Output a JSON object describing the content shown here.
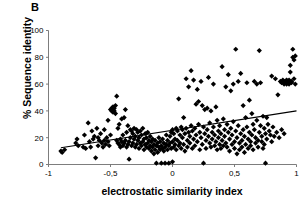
{
  "panel": {
    "label": "B"
  },
  "chart_data": {
    "type": "scatter",
    "title": "",
    "xlabel": "electrostatic similarity index",
    "ylabel": "% Sequence identity",
    "xlim": [
      -1,
      1
    ],
    "ylim": [
      0,
      100
    ],
    "xticks": [
      -1,
      -0.5,
      0,
      0.5,
      1
    ],
    "xticklabels": [
      "-1",
      "-0,5",
      "0",
      "0,5",
      "1"
    ],
    "yticks": [
      0,
      20,
      40,
      60,
      80,
      100
    ],
    "yticklabels": [
      "0",
      "20",
      "40",
      "60",
      "80",
      "100"
    ],
    "grid": false,
    "legend": null,
    "marker": "diamond",
    "marker_color": "#000000",
    "marker_size": 2.6,
    "trendline": {
      "type": "linear",
      "color": "#000000",
      "x_start": -0.9,
      "y_start": 12.5,
      "x_end": 1.0,
      "y_end": 40.0
    },
    "points": [
      [
        -0.9,
        10
      ],
      [
        -0.89,
        9
      ],
      [
        -0.87,
        11
      ],
      [
        -0.78,
        16
      ],
      [
        -0.77,
        19
      ],
      [
        -0.76,
        14
      ],
      [
        -0.72,
        13
      ],
      [
        -0.71,
        22
      ],
      [
        -0.7,
        12
      ],
      [
        -0.68,
        31
      ],
      [
        -0.67,
        17
      ],
      [
        -0.66,
        13
      ],
      [
        -0.65,
        25
      ],
      [
        -0.64,
        19
      ],
      [
        -0.63,
        21
      ],
      [
        -0.62,
        5
      ],
      [
        -0.61,
        27
      ],
      [
        -0.6,
        14
      ],
      [
        -0.6,
        20
      ],
      [
        -0.59,
        18
      ],
      [
        -0.58,
        23
      ],
      [
        -0.57,
        16
      ],
      [
        -0.56,
        13
      ],
      [
        -0.55,
        26
      ],
      [
        -0.55,
        18
      ],
      [
        -0.54,
        15
      ],
      [
        -0.53,
        20
      ],
      [
        -0.52,
        17
      ],
      [
        -0.52,
        33
      ],
      [
        -0.51,
        14
      ],
      [
        -0.5,
        22
      ],
      [
        -0.5,
        41
      ],
      [
        -0.49,
        42
      ],
      [
        -0.49,
        40
      ],
      [
        -0.48,
        43
      ],
      [
        -0.48,
        41
      ],
      [
        -0.48,
        39
      ],
      [
        -0.47,
        42
      ],
      [
        -0.47,
        40
      ],
      [
        -0.46,
        44
      ],
      [
        -0.46,
        38
      ],
      [
        -0.45,
        51
      ],
      [
        -0.45,
        18
      ],
      [
        -0.44,
        16
      ],
      [
        -0.44,
        27
      ],
      [
        -0.43,
        15
      ],
      [
        -0.43,
        30
      ],
      [
        -0.42,
        19
      ],
      [
        -0.42,
        13
      ],
      [
        -0.41,
        17
      ],
      [
        -0.41,
        34
      ],
      [
        -0.4,
        14
      ],
      [
        -0.4,
        22
      ],
      [
        -0.39,
        16
      ],
      [
        -0.39,
        35
      ],
      [
        -0.38,
        41
      ],
      [
        -0.38,
        18
      ],
      [
        -0.37,
        13
      ],
      [
        -0.37,
        24
      ],
      [
        -0.36,
        15
      ],
      [
        -0.36,
        29
      ],
      [
        -0.35,
        17
      ],
      [
        -0.35,
        4
      ],
      [
        -0.34,
        20
      ],
      [
        -0.34,
        26
      ],
      [
        -0.33,
        14
      ],
      [
        -0.33,
        25
      ],
      [
        -0.32,
        16
      ],
      [
        -0.32,
        23
      ],
      [
        -0.31,
        19
      ],
      [
        -0.31,
        27
      ],
      [
        -0.3,
        13
      ],
      [
        -0.3,
        21
      ],
      [
        -0.29,
        15
      ],
      [
        -0.29,
        26
      ],
      [
        -0.28,
        18
      ],
      [
        -0.28,
        24
      ],
      [
        -0.27,
        12
      ],
      [
        -0.27,
        20
      ],
      [
        -0.26,
        16
      ],
      [
        -0.26,
        25
      ],
      [
        -0.25,
        14
      ],
      [
        -0.25,
        22
      ],
      [
        -0.24,
        17
      ],
      [
        -0.24,
        27
      ],
      [
        -0.23,
        11
      ],
      [
        -0.23,
        19
      ],
      [
        -0.22,
        15
      ],
      [
        -0.22,
        23
      ],
      [
        -0.21,
        13
      ],
      [
        -0.21,
        20
      ],
      [
        -0.2,
        16
      ],
      [
        -0.2,
        24
      ],
      [
        -0.19,
        12
      ],
      [
        -0.19,
        18
      ],
      [
        -0.18,
        14
      ],
      [
        -0.18,
        21
      ],
      [
        -0.17,
        10
      ],
      [
        -0.17,
        17
      ],
      [
        -0.16,
        13
      ],
      [
        -0.16,
        19
      ],
      [
        -0.15,
        8
      ],
      [
        -0.15,
        15
      ],
      [
        -0.14,
        11
      ],
      [
        -0.14,
        18
      ],
      [
        -0.13,
        14
      ],
      [
        -0.13,
        1
      ],
      [
        -0.12,
        16
      ],
      [
        -0.12,
        9
      ],
      [
        -0.11,
        13
      ],
      [
        -0.11,
        20
      ],
      [
        -0.1,
        11
      ],
      [
        -0.1,
        17
      ],
      [
        -0.09,
        1
      ],
      [
        -0.09,
        14
      ],
      [
        -0.08,
        12
      ],
      [
        -0.08,
        19
      ],
      [
        -0.07,
        10
      ],
      [
        -0.07,
        16
      ],
      [
        -0.06,
        1
      ],
      [
        -0.06,
        13
      ],
      [
        -0.05,
        22
      ],
      [
        -0.05,
        15
      ],
      [
        -0.04,
        11
      ],
      [
        -0.04,
        18
      ],
      [
        -0.03,
        1
      ],
      [
        -0.03,
        14
      ],
      [
        -0.02,
        21
      ],
      [
        -0.02,
        16
      ],
      [
        -0.01,
        12
      ],
      [
        -0.01,
        24
      ],
      [
        0.0,
        2
      ],
      [
        0.0,
        17
      ],
      [
        0.0,
        26
      ],
      [
        0.01,
        13
      ],
      [
        0.01,
        23
      ],
      [
        0.02,
        19
      ],
      [
        0.02,
        15
      ],
      [
        0.03,
        27
      ],
      [
        0.03,
        11
      ],
      [
        0.04,
        25
      ],
      [
        0.04,
        18
      ],
      [
        0.05,
        49
      ],
      [
        0.05,
        14
      ],
      [
        0.06,
        22
      ],
      [
        0.06,
        16
      ],
      [
        0.07,
        28
      ],
      [
        0.07,
        12
      ],
      [
        0.08,
        20
      ],
      [
        0.08,
        26
      ],
      [
        0.09,
        35
      ],
      [
        0.09,
        15
      ],
      [
        0.1,
        23
      ],
      [
        0.1,
        10
      ],
      [
        0.11,
        64
      ],
      [
        0.11,
        27
      ],
      [
        0.12,
        18
      ],
      [
        0.12,
        13
      ],
      [
        0.13,
        58
      ],
      [
        0.13,
        24
      ],
      [
        0.14,
        21
      ],
      [
        0.14,
        16
      ],
      [
        0.15,
        70
      ],
      [
        0.15,
        29
      ],
      [
        0.16,
        12
      ],
      [
        0.16,
        25
      ],
      [
        0.17,
        63
      ],
      [
        0.17,
        19
      ],
      [
        0.18,
        14
      ],
      [
        0.18,
        27
      ],
      [
        0.19,
        45
      ],
      [
        0.19,
        22
      ],
      [
        0.2,
        56
      ],
      [
        0.2,
        17
      ],
      [
        0.21,
        47
      ],
      [
        0.21,
        30
      ],
      [
        0.22,
        11
      ],
      [
        0.22,
        24
      ],
      [
        0.23,
        62
      ],
      [
        0.23,
        20
      ],
      [
        0.24,
        44
      ],
      [
        0.24,
        15
      ],
      [
        0.25,
        28
      ],
      [
        0.25,
        1
      ],
      [
        0.26,
        41
      ],
      [
        0.26,
        23
      ],
      [
        0.27,
        18
      ],
      [
        0.27,
        12
      ],
      [
        0.28,
        42
      ],
      [
        0.28,
        26
      ],
      [
        0.29,
        65
      ],
      [
        0.29,
        21
      ],
      [
        0.3,
        16
      ],
      [
        0.3,
        31
      ],
      [
        0.31,
        40
      ],
      [
        0.31,
        13
      ],
      [
        0.32,
        24
      ],
      [
        0.32,
        19
      ],
      [
        0.33,
        60
      ],
      [
        0.33,
        28
      ],
      [
        0.34,
        14
      ],
      [
        0.34,
        22
      ],
      [
        0.35,
        43
      ],
      [
        0.35,
        17
      ],
      [
        0.36,
        33
      ],
      [
        0.36,
        11
      ],
      [
        0.37,
        25
      ],
      [
        0.37,
        20
      ],
      [
        0.38,
        15
      ],
      [
        0.38,
        29
      ],
      [
        0.39,
        12
      ],
      [
        0.39,
        23
      ],
      [
        0.4,
        73
      ],
      [
        0.4,
        18
      ],
      [
        0.41,
        34
      ],
      [
        0.41,
        14
      ],
      [
        0.42,
        26
      ],
      [
        0.42,
        21
      ],
      [
        0.43,
        58
      ],
      [
        0.43,
        16
      ],
      [
        0.44,
        30
      ],
      [
        0.44,
        13
      ],
      [
        0.45,
        67
      ],
      [
        0.45,
        24
      ],
      [
        0.46,
        19
      ],
      [
        0.46,
        10
      ],
      [
        0.47,
        55
      ],
      [
        0.47,
        27
      ],
      [
        0.48,
        22
      ],
      [
        0.48,
        15
      ],
      [
        0.49,
        60
      ],
      [
        0.49,
        32
      ],
      [
        0.5,
        17
      ],
      [
        0.5,
        12
      ],
      [
        0.51,
        86
      ],
      [
        0.51,
        25
      ],
      [
        0.52,
        20
      ],
      [
        0.52,
        8
      ],
      [
        0.53,
        62
      ],
      [
        0.53,
        29
      ],
      [
        0.54,
        16
      ],
      [
        0.54,
        11
      ],
      [
        0.55,
        68
      ],
      [
        0.55,
        23
      ],
      [
        0.56,
        18
      ],
      [
        0.56,
        13
      ],
      [
        0.57,
        44
      ],
      [
        0.57,
        26
      ],
      [
        0.58,
        21
      ],
      [
        0.58,
        9
      ],
      [
        0.59,
        35
      ],
      [
        0.59,
        15
      ],
      [
        0.6,
        61
      ],
      [
        0.6,
        28
      ],
      [
        0.61,
        19
      ],
      [
        0.61,
        12
      ],
      [
        0.62,
        48
      ],
      [
        0.62,
        24
      ],
      [
        0.63,
        17
      ],
      [
        0.63,
        14
      ],
      [
        0.64,
        38
      ],
      [
        0.64,
        22
      ],
      [
        0.65,
        30
      ],
      [
        0.65,
        11
      ],
      [
        0.66,
        62
      ],
      [
        0.66,
        26
      ],
      [
        0.67,
        20
      ],
      [
        0.67,
        16
      ],
      [
        0.68,
        60
      ],
      [
        0.68,
        33
      ],
      [
        0.69,
        18
      ],
      [
        0.69,
        13
      ],
      [
        0.7,
        85
      ],
      [
        0.7,
        24
      ],
      [
        0.71,
        61
      ],
      [
        0.71,
        29
      ],
      [
        0.72,
        17
      ],
      [
        0.72,
        21
      ],
      [
        0.73,
        36
      ],
      [
        0.73,
        12
      ],
      [
        0.74,
        27
      ],
      [
        0.74,
        15
      ],
      [
        0.75,
        23
      ],
      [
        0.75,
        1
      ],
      [
        0.76,
        35
      ],
      [
        0.76,
        19
      ],
      [
        0.77,
        30
      ],
      [
        0.78,
        25
      ],
      [
        0.79,
        22
      ],
      [
        0.8,
        66
      ],
      [
        0.8,
        17
      ],
      [
        0.81,
        28
      ],
      [
        0.82,
        21
      ],
      [
        0.83,
        64
      ],
      [
        0.84,
        24
      ],
      [
        0.85,
        52
      ],
      [
        0.86,
        20
      ],
      [
        0.87,
        62
      ],
      [
        0.88,
        61
      ],
      [
        0.88,
        26
      ],
      [
        0.89,
        63
      ],
      [
        0.9,
        60
      ],
      [
        0.9,
        23
      ],
      [
        0.91,
        62
      ],
      [
        0.91,
        61
      ],
      [
        0.92,
        63
      ],
      [
        0.92,
        60
      ],
      [
        0.93,
        62
      ],
      [
        0.93,
        61
      ],
      [
        0.94,
        60
      ],
      [
        0.94,
        63
      ],
      [
        0.95,
        69
      ],
      [
        0.95,
        74
      ],
      [
        0.96,
        62
      ],
      [
        0.96,
        61
      ],
      [
        0.97,
        86
      ],
      [
        0.97,
        80
      ],
      [
        0.98,
        78
      ],
      [
        0.98,
        64
      ],
      [
        0.99,
        81
      ],
      [
        0.99,
        60
      ]
    ]
  }
}
